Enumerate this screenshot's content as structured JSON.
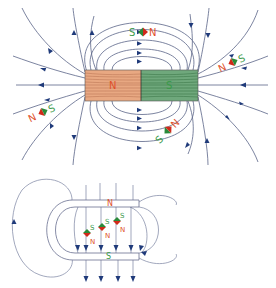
{
  "diagram": {
    "colors": {
      "field_line": "#5a6488",
      "arrow": "#1f3a7a",
      "north_fill": "#e8a882",
      "south_fill": "#6fa87c",
      "north_text": "#e0502a",
      "south_text": "#3a9a4a",
      "compass_red": "#d02a1a",
      "compass_green": "#2a8a3a"
    },
    "bar_magnet": {
      "north_label": "N",
      "south_label": "S"
    },
    "compasses": [
      {
        "id": "top",
        "left_label": "S",
        "right_label": "N"
      },
      {
        "id": "right",
        "left_label": "N",
        "right_label": "S"
      },
      {
        "id": "left",
        "left_label": "N",
        "right_label": "S"
      },
      {
        "id": "bottom",
        "left_label": "S",
        "right_label": "N"
      }
    ],
    "horseshoe_magnet": {
      "north_label": "N",
      "south_label": "S",
      "compasses": [
        {
          "top_label": "S",
          "bottom_label": "N"
        },
        {
          "top_label": "S",
          "bottom_label": "N"
        },
        {
          "top_label": "S",
          "bottom_label": "N"
        }
      ]
    }
  }
}
